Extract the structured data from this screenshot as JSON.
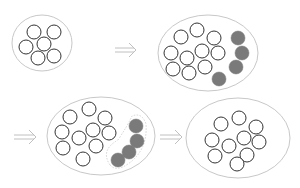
{
  "colors": {
    "background": "#ffffff",
    "container_stroke": "#c8c8c8",
    "circle_stroke": "#333333",
    "filled": "#7a7a7a",
    "arrow": "#c0c0c0",
    "dashed": "#c8c8c8"
  },
  "panels": [
    {
      "name": "initial-group",
      "container": {
        "cx": 42,
        "cy": 43,
        "rx": 30,
        "ry": 28
      },
      "open": [
        [
          34,
          32
        ],
        [
          54,
          32
        ],
        [
          26,
          47
        ],
        [
          44,
          44
        ],
        [
          38,
          58
        ],
        [
          54,
          56
        ]
      ],
      "filled": []
    },
    {
      "name": "group-with-newcomers",
      "container": {
        "cx": 208,
        "cy": 53,
        "rx": 50,
        "ry": 38
      },
      "open": [
        [
          181,
          37
        ],
        [
          197,
          30
        ],
        [
          214,
          38
        ],
        [
          171,
          53
        ],
        [
          187,
          58
        ],
        [
          202,
          51
        ],
        [
          218,
          53
        ],
        [
          173,
          69
        ],
        [
          189,
          73
        ],
        [
          205,
          67
        ]
      ],
      "filled": [
        [
          238,
          38
        ],
        [
          242,
          53
        ],
        [
          236,
          67
        ],
        [
          219,
          79
        ]
      ]
    },
    {
      "name": "group-with-subgroup",
      "container": {
        "cx": 101,
        "cy": 136,
        "rx": 54,
        "ry": 39
      },
      "open": [
        [
          70,
          117
        ],
        [
          89,
          109
        ],
        [
          105,
          118
        ],
        [
          62,
          132
        ],
        [
          79,
          138
        ],
        [
          93,
          130
        ],
        [
          109,
          133
        ],
        [
          63,
          148
        ],
        [
          96,
          146
        ],
        [
          83,
          159
        ]
      ],
      "filled": [
        [
          136,
          126
        ],
        [
          137,
          141
        ],
        [
          129,
          152
        ],
        [
          118,
          160
        ]
      ],
      "subgroup": true
    },
    {
      "name": "final-group",
      "container": {
        "cx": 238,
        "cy": 138,
        "rx": 52,
        "ry": 40
      },
      "open": [
        [
          221,
          124
        ],
        [
          239,
          118
        ],
        [
          256,
          127
        ],
        [
          212,
          140
        ],
        [
          229,
          146
        ],
        [
          244,
          138
        ],
        [
          259,
          142
        ],
        [
          215,
          156
        ],
        [
          247,
          155
        ],
        [
          237,
          164
        ]
      ],
      "filled": []
    }
  ],
  "arrows": [
    {
      "x1": 115,
      "x2": 136,
      "y": 50
    },
    {
      "x1": 14,
      "x2": 36,
      "y": 137
    },
    {
      "x1": 160,
      "x2": 182,
      "y": 137
    }
  ],
  "circle_radius": 7
}
